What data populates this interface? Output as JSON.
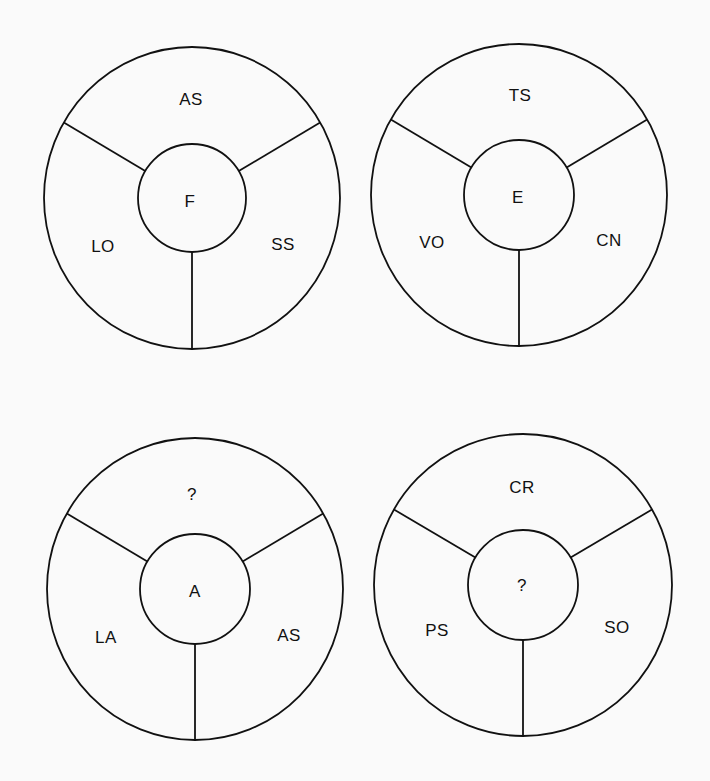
{
  "puzzle": {
    "wheels": [
      {
        "id": "top-left",
        "cx": 192,
        "cy": 198,
        "rx": 148,
        "ry": 151,
        "inner_r": 54,
        "center": "F",
        "top": "AS",
        "left": "LO",
        "right": "SS"
      },
      {
        "id": "top-right",
        "cx": 519,
        "cy": 195,
        "rx": 148,
        "ry": 151,
        "inner_r": 55,
        "center": "E",
        "top": "TS",
        "left": "VO",
        "right": "CN"
      },
      {
        "id": "bottom-left",
        "cx": 195,
        "cy": 589,
        "rx": 148,
        "ry": 151,
        "inner_r": 55,
        "center": "A",
        "top": "?",
        "left": "LA",
        "right": "AS"
      },
      {
        "id": "bottom-right",
        "cx": 523,
        "cy": 585,
        "rx": 149,
        "ry": 151,
        "inner_r": 55,
        "center": "?",
        "top": "CR",
        "left": "PS",
        "right": "SO"
      }
    ]
  },
  "style": {
    "background": "#fafafa",
    "stroke": "#111111"
  }
}
